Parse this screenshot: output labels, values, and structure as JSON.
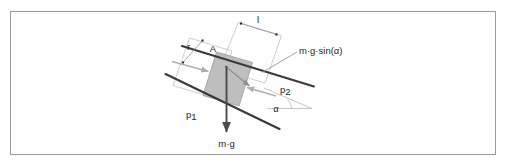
{
  "figure": {
    "domain": "Diagram",
    "frame": {
      "border_color": "#9a9a9e",
      "background_color": "#fefefe"
    },
    "colors": {
      "block_fill": "#b8b8b8",
      "block_stroke": "#8a8a8a",
      "heavy_line": "#3a3a3a",
      "light_line": "#b5b5b5",
      "arrow_dark": "#4a4a4a",
      "arrow_light": "#b0b0b0",
      "text": "#262626"
    },
    "labels": {
      "length_l": "l",
      "radius_r": "r",
      "area_A": "A",
      "force_gravity": "m·g",
      "force_component": "m·g·sin(α)",
      "plane_lower": "p",
      "plane_lower_sub": "1",
      "plane_upper": "p",
      "plane_upper_sub": "2",
      "angle": "α"
    },
    "elements": {
      "block_description": "shaded parallelogram slab between the two parallel planes",
      "plane_upper_description": "upper inclined plane line p2",
      "plane_lower_description": "lower inclined plane line p1",
      "gravity_arrow_description": "vertical downward arrow labelled m·g",
      "component_arrow_description": "arrow along the incline labelled m·g·sin(alpha)",
      "angle_arc_description": "angle alpha between the incline and the horizontal reference line",
      "dimension_l_description": "dimension line across the slab top labelled l",
      "dimension_r_description": "dimension line across the slab thickness labelled r"
    }
  }
}
